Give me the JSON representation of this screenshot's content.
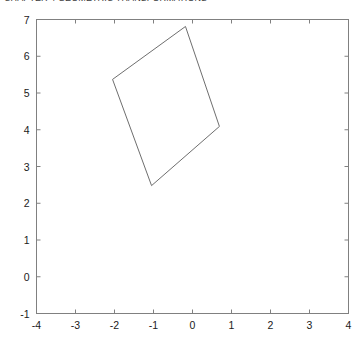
{
  "figure": {
    "title": "CHAPTER 4  GEOMETRIC TRANSFORMATIONS",
    "background_color": "#ffffff"
  },
  "axes": {
    "frame_color": "#808080",
    "x_axis": {
      "label": "",
      "min": -4,
      "max": 4,
      "ticks": [
        -4,
        -3,
        -2,
        -1,
        0,
        1,
        2,
        3,
        4
      ],
      "tick_labels": [
        "-4",
        "-3",
        "-2",
        "-1",
        "0",
        "1",
        "2",
        "3",
        "4"
      ]
    },
    "y_axis": {
      "label": "",
      "min": -1,
      "max": 7,
      "ticks": [
        -1,
        0,
        1,
        2,
        3,
        4,
        5,
        6,
        7
      ],
      "tick_labels": [
        "-1",
        "0",
        "1",
        "2",
        "3",
        "4",
        "5",
        "6",
        "7"
      ]
    }
  },
  "chart_data": {
    "type": "line",
    "title": "CHAPTER 4  GEOMETRIC TRANSFORMATIONS",
    "xlabel": "",
    "ylabel": "",
    "xlim": [
      -4,
      4
    ],
    "ylim": [
      -1,
      7
    ],
    "grid": false,
    "legend": null,
    "series": [
      {
        "name": "rotated-square",
        "type": "closed-polygon",
        "color": "#6e6e6e",
        "line_width": 1,
        "x": [
          -0.18,
          -2.05,
          -1.05,
          0.69,
          -0.18
        ],
        "y": [
          6.81,
          5.37,
          2.48,
          4.09,
          6.81
        ]
      }
    ]
  }
}
